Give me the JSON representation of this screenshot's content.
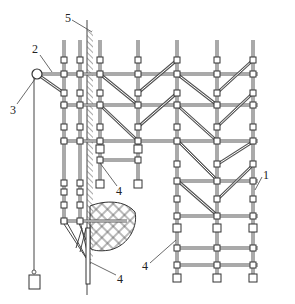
{
  "diagram": {
    "title": "",
    "type": "scaffolding construction diagram",
    "colors": {
      "line": "#333333",
      "background": "#ffffff",
      "hatch": "#555555"
    },
    "labels": [
      {
        "id": "1",
        "text": "1",
        "x": 262,
        "y": 175,
        "target": "right column pole"
      },
      {
        "id": "2",
        "text": "2",
        "x": 36,
        "y": 52,
        "target": "top horizontal beam"
      },
      {
        "id": "3",
        "text": "3",
        "x": 12,
        "y": 112,
        "target": "pulley"
      },
      {
        "id": "4a",
        "text": "4",
        "x": 118,
        "y": 192,
        "target": "hanging pole end"
      },
      {
        "id": "4b",
        "text": "4",
        "x": 118,
        "y": 278,
        "target": "cantilever brace"
      },
      {
        "id": "4c",
        "text": "4",
        "x": 143,
        "y": 266,
        "target": "right column pole"
      },
      {
        "id": "5",
        "text": "5",
        "x": 68,
        "y": 24,
        "target": "building wall"
      }
    ]
  }
}
